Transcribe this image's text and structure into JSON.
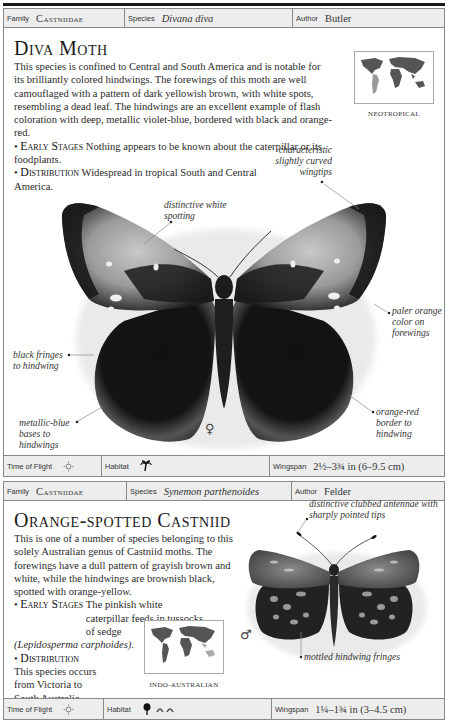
{
  "entries": [
    {
      "header": {
        "family_label": "Family",
        "family": "Castniidae",
        "species_label": "Species",
        "species": "Divana diva",
        "author_label": "Author",
        "author": "Butler"
      },
      "title": "Diva Moth",
      "description": "This species is confined to Central and South America and is notable for its brilliantly colored hindwings. The forewings of this moth are well camouflaged with a pattern of dark yellowish brown, with white spots, resembling a dead leaf. The hindwings are an excellent example of flash coloration with deep, metallic violet-blue, bordered with black and orange-red.",
      "early_stages_label": "Early Stages",
      "early_stages": "Nothing appears to be known about the caterpillar or its foodplants.",
      "distribution_label": "Distribution",
      "distribution": "Widespread in tropical South and Central America.",
      "map_label": "NEOTROPICAL",
      "annotations": {
        "wingtips": "characteristic slightly curved wingtips",
        "spotting": "distinctive white spotting",
        "paler": "paler orange color on forewings",
        "fringes": "black fringes to hindwing",
        "bases": "metallic-blue bases to hindwings",
        "border": "orange-red border to hindwing"
      },
      "sex_symbol": "♀",
      "footer": {
        "time_label": "Time of Flight",
        "time_icon": "sun-icon",
        "habitat_label": "Habitat",
        "habitat_icons": [
          "palm-tree-icon"
        ],
        "wingspan_label": "Wingspan",
        "wingspan": "2½–3¾ in (6–9.5 cm)"
      }
    },
    {
      "header": {
        "family_label": "Family",
        "family": "Castniidae",
        "species_label": "Species",
        "species": "Synemon parthenoides",
        "author_label": "Author",
        "author": "Felder"
      },
      "title": "Orange-spotted Castniid",
      "description": "This is one of a number of species belonging to this solely Australian genus of Castniid moths. The forewings have a dull pattern of grayish brown and white, while the hindwings are brownish black, spotted with orange-yellow.",
      "early_stages_label": "Early Stages",
      "early_stages": "The pinkish white caterpillar feeds in tussocks of sedge",
      "early_stages_latin": "(Lepidosperma carphoides).",
      "distribution_label": "Distribution",
      "distribution": "This species occurs from Victoria to South Australia.",
      "map_label": "INDO-AUSTRALIAN",
      "annotations": {
        "antennae": "distinctive clubbed antennae with sharply pointed tips",
        "fringes": "mottled hindwing fringes"
      },
      "sex_symbol": "♂",
      "footer": {
        "time_label": "Time of Flight",
        "time_icon": "sun-icon",
        "habitat_label": "Habitat",
        "habitat_icons": [
          "tree-icon",
          "grass-tussock-icon"
        ],
        "wingspan_label": "Wingspan",
        "wingspan": "1¼–1¾ in (3–4.5 cm)"
      }
    }
  ],
  "colors": {
    "header_bg": "#ededed",
    "border": "#888888",
    "text": "#2a2a2a"
  }
}
